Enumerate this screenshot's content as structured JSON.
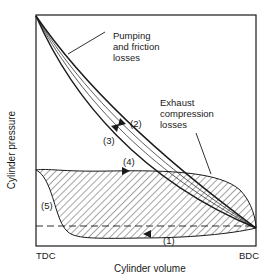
{
  "diagram": {
    "type": "pressure-volume indicator diagram",
    "y_axis_label": "Cylinder pressure",
    "x_axis_label": "Cylinder volume",
    "x_ticks": [
      "TDC",
      "BDC"
    ],
    "annotations": {
      "pumping": "Pumping\nand friction\nlosses",
      "pumping_lines": [
        "Pumping",
        "and friction",
        "losses"
      ],
      "exhaust_lines": [
        "Exhaust",
        "compression",
        "losses"
      ]
    },
    "stroke_labels": [
      "(1)",
      "(2)",
      "(3)",
      "(4)",
      "(5)"
    ],
    "colors": {
      "ink": "#1a1a1a",
      "background": "#ffffff"
    }
  }
}
